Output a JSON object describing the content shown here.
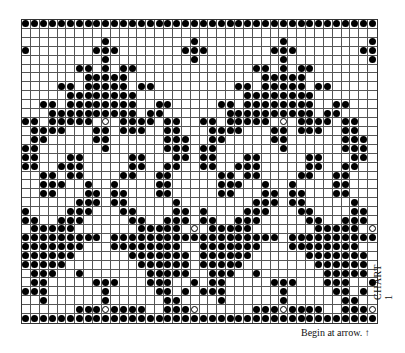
{
  "chart_title": "CHART 1",
  "caption": "Begin at arrow. ↑",
  "grid": {
    "columns": 40,
    "rows": 34,
    "repeat_width": 20,
    "legend": {
      "f": "filled-dot",
      "o": "open-circle",
      ".": "empty"
    },
    "pattern_rows": [
      "ffffffffffffffffffff",
      "....................",
      ".........f.........f",
      "f.......fff.......ff",
      ".........f.........f",
      "......ff.f.ff.......",
      ".......fffff........",
      "....ff.fffff.ff.....",
      ".....ffffffff.......",
      "..ff.ffffffff..ff...",
      "...ffffffffff.ff....",
      "ff.fffff.o.ffff.ff..",
      ".ffff...ff.fff..ff..",
      ".ff.....ff......fff.",
      "ff.......f......fff.",
      "ff...ff.....ff...ff.",
      "ff..fff.....ff..ff..",
      "..ff.ff....ff..ff...",
      "..fff..f..f....ff...",
      "..ff...ff.ff...ff...",
      "......fff.ff.....f..",
      "f....fff...ff....ff.",
      "ff..fff.....ff..fff.",
      ".fffff.......fffff.o",
      "fffffffff.ffffffffff",
      "fffffff...ffffffff..",
      "ffffff......fffffff.",
      "fffff........ffffff.",
      ".fff..f.......fffff.",
      ".ff.....fff...fff..f",
      "fff......f.....ff.f.",
      "..f......f......ff..",
      "......fffoffff..fffo",
      "ffffffffffffffffffff"
    ]
  },
  "colors": {
    "ink": "#000000",
    "paper": "#ffffff",
    "gridline": "#555555"
  }
}
